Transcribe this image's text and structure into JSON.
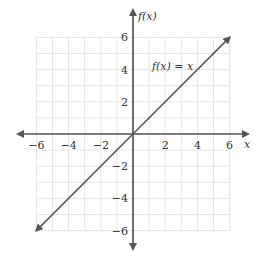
{
  "chart_data": {
    "type": "line",
    "title": "",
    "xlabel": "x",
    "ylabel": "f(x)",
    "xlim": [
      -6,
      6
    ],
    "ylim": [
      -6,
      6
    ],
    "grid": true,
    "x_ticks": [
      "-6",
      "-4",
      "-2",
      "2",
      "4",
      "6"
    ],
    "y_ticks": [
      "6",
      "4",
      "2",
      "-2",
      "-4",
      "-6"
    ],
    "series": [
      {
        "name": "f(x) = x",
        "x": [
          -6,
          6
        ],
        "y": [
          -6,
          6
        ]
      }
    ],
    "annotations": [
      {
        "text": "f(x) = x",
        "x": 2,
        "y": 4
      }
    ]
  },
  "labels": {
    "x_axis": "x",
    "y_axis": "f(x)",
    "function": "f(x) = x",
    "xt": [
      "−6",
      "−4",
      "−2",
      "2",
      "4",
      "6"
    ],
    "yt": [
      "6",
      "4",
      "2",
      "−2",
      "−4",
      "−6"
    ]
  },
  "colors": {
    "axis": "#555555",
    "line": "#555555",
    "grid": "#e6e6e6"
  }
}
